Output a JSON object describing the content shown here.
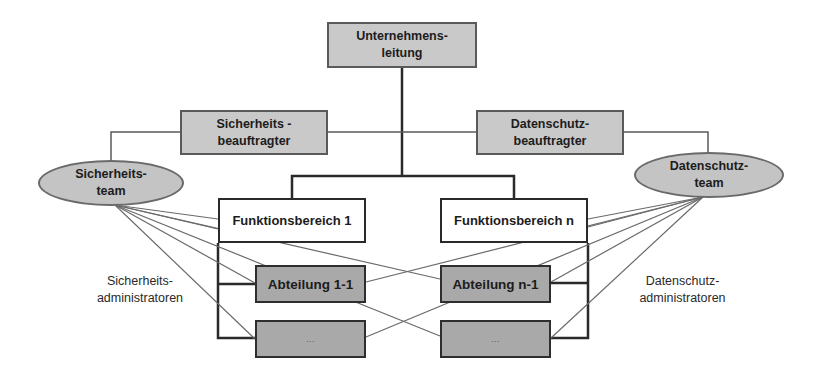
{
  "diagram": {
    "nodes": {
      "management": {
        "line1": "Unternehmens-",
        "line2": "leitung"
      },
      "security_officer": {
        "line1": "Sicherheits -",
        "line2": "beauftragter"
      },
      "privacy_officer": {
        "line1": "Datenschutz-",
        "line2": "beauftragter"
      },
      "security_team": {
        "line1": "Sicherheits-",
        "line2": "team"
      },
      "privacy_team": {
        "line1": "Datenschutz-",
        "line2": "team"
      },
      "function_area_1": {
        "label": "Funktionsbereich 1"
      },
      "function_area_n": {
        "label": "Funktionsbereich n"
      },
      "department_1_1": {
        "label": "Abteilung 1-1"
      },
      "department_n_1": {
        "label": "Abteilung n-1"
      },
      "department_1_more": {
        "label": "..."
      },
      "department_n_more": {
        "label": "..."
      }
    },
    "labels": {
      "security_admins": {
        "line1": "Sicherheits-",
        "line2": "administratoren"
      },
      "privacy_admins": {
        "line1": "Datenschutz-",
        "line2": "administratoren"
      }
    },
    "colors": {
      "gray_box": "#c9c9c9",
      "dark_box": "#a9a9a9",
      "ellipse": "#c4c4c4",
      "line_dark": "#2a2a2a",
      "line_light": "#6a6a6a"
    }
  }
}
